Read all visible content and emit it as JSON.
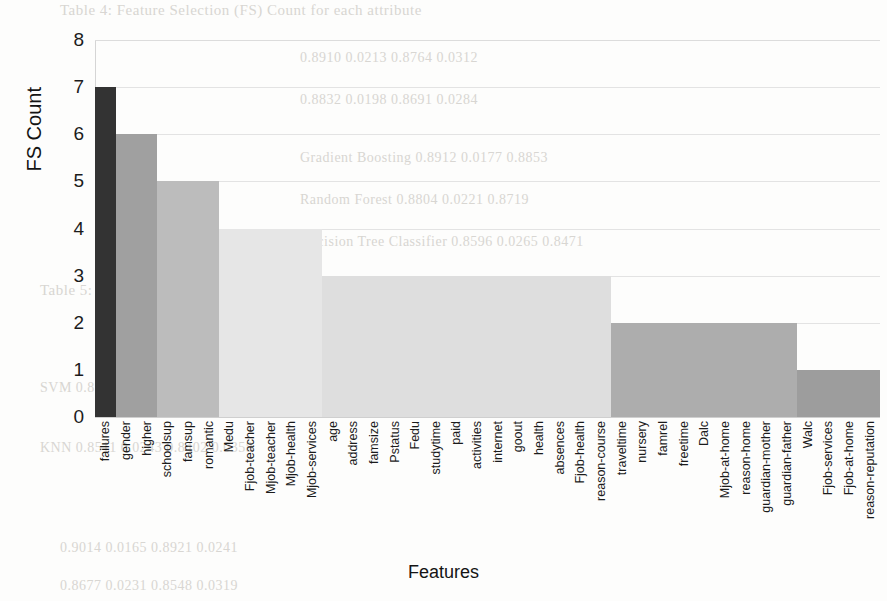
{
  "chart_data": {
    "type": "bar",
    "title": "",
    "xlabel": "Features",
    "ylabel": "FS Count",
    "ylim": [
      0,
      8
    ],
    "yticks": [
      0,
      1,
      2,
      3,
      4,
      5,
      6,
      7,
      8
    ],
    "grid": "horizontal",
    "legend": "none",
    "orientation": "vertical",
    "sorted": "descending",
    "categories": [
      "failures",
      "gender",
      "higher",
      "schoolsup",
      "famsup",
      "romantic",
      "Medu",
      "Fjob-teacher",
      "Mjob-teacher",
      "Mjob-health",
      "Mjob-services",
      "age",
      "address",
      "famsize",
      "Pstatus",
      "Fedu",
      "studytime",
      "paid",
      "activities",
      "internet",
      "goout",
      "health",
      "absences",
      "Fjob-health",
      "reason-course",
      "traveltime",
      "nursery",
      "famrel",
      "freetime",
      "Dalc",
      "Mjob-at-home",
      "reason-home",
      "guardian-mother",
      "guardian-father",
      "Walc",
      "Fjob-services",
      "Fjob-at-home",
      "reason-reputation"
    ],
    "values": [
      7,
      6,
      6,
      5,
      5,
      5,
      4,
      4,
      4,
      4,
      4,
      3,
      3,
      3,
      3,
      3,
      3,
      3,
      3,
      3,
      3,
      3,
      3,
      3,
      3,
      2,
      2,
      2,
      2,
      2,
      2,
      2,
      2,
      2,
      1,
      1,
      1,
      1
    ],
    "bar_colors": [
      "#333333",
      "#a0a0a0",
      "#a0a0a0",
      "#bcbcbc",
      "#bcbcbc",
      "#bcbcbc",
      "#e6e6e6",
      "#e6e6e6",
      "#e6e6e6",
      "#e6e6e6",
      "#e6e6e6",
      "#dedede",
      "#dedede",
      "#dedede",
      "#dedede",
      "#dedede",
      "#dedede",
      "#dedede",
      "#dedede",
      "#dedede",
      "#dedede",
      "#dedede",
      "#dedede",
      "#dedede",
      "#dedede",
      "#adadad",
      "#adadad",
      "#adadad",
      "#adadad",
      "#adadad",
      "#adadad",
      "#adadad",
      "#adadad",
      "#adadad",
      "#9d9d9d",
      "#9d9d9d",
      "#9d9d9d",
      "#9d9d9d"
    ]
  },
  "axis": {
    "y_title": "FS Count",
    "x_title": "Features"
  },
  "background_text": {
    "lines": [
      "Table 4: Feature Selection (FS) Count for each attribute",
      "0.8910    0.0213    0.8764    0.0312",
      "0.8832    0.0198    0.8691    0.0284",
      "0.8745    0.0207    0.8602    0.0341",
      "Accuracy    Precision    Recall    F1-Score",
      "Gradient Boosting    0.8912    0.0177    0.8853",
      "Random Forest    0.8804    0.0221    0.8719",
      "Decision Tree Classifier    0.8596    0.0265    0.8471",
      "Table 5: Performance comparison of classifiers",
      "SVM    0.8723    0.0189    0.8655    0.0297",
      "KNN    0.8511    0.0243    0.8402    0.0358",
      "0.9014    0.0165    0.8921    0.0241",
      "0.8677    0.0231    0.8548    0.0319"
    ]
  }
}
